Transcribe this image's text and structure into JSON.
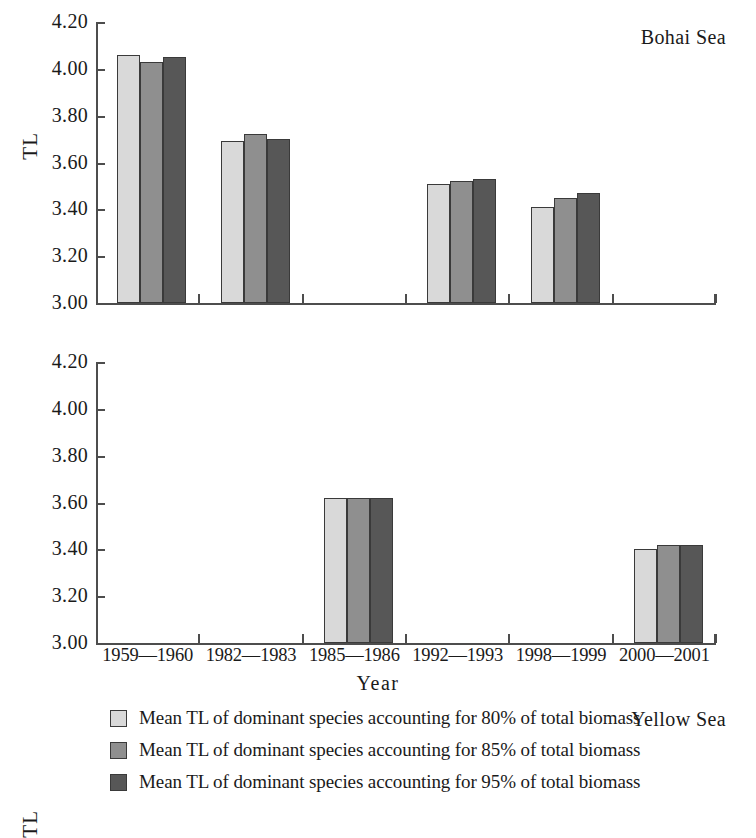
{
  "chart_data": {
    "type": "bar",
    "title": "",
    "xlabel": "Year",
    "ylabel": "TL",
    "ylim": [
      3.0,
      4.2
    ],
    "ytick_labels": [
      "4.20",
      "4.00",
      "3.80",
      "3.60",
      "3.40",
      "3.20",
      "3.00"
    ],
    "ytick_values": [
      4.2,
      4.0,
      3.8,
      3.6,
      3.4,
      3.2,
      3.0
    ],
    "grid": false,
    "legend_position": "bottom",
    "categories": [
      "1959—1960",
      "1982—1983",
      "1985—1986",
      "1992—1993",
      "1998—1999",
      "2000—2001"
    ],
    "legend": [
      "Mean TL of dominant species accounting for 80% of total biomass",
      "Mean TL of dominant species accounting for 85% of total biomass",
      "Mean TL of dominant species accounting for 95% of total biomass"
    ],
    "series_colors": [
      "#d9d9d9",
      "#8f8f8f",
      "#575757"
    ],
    "panels": [
      {
        "name": "Bohai Sea",
        "series": [
          {
            "name": "Mean TL of dominant species accounting for 80% of total biomass",
            "values": [
              4.06,
              3.69,
              null,
              3.51,
              3.41,
              null
            ]
          },
          {
            "name": "Mean TL of dominant species accounting for 85% of total biomass",
            "values": [
              4.03,
              3.72,
              null,
              3.52,
              3.45,
              null
            ]
          },
          {
            "name": "Mean TL of dominant species accounting for 95% of total biomass",
            "values": [
              4.05,
              3.7,
              null,
              3.53,
              3.47,
              null
            ]
          }
        ]
      },
      {
        "name": "Yellow Sea",
        "series": [
          {
            "name": "Mean TL of dominant species accounting for 80% of total biomass",
            "values": [
              null,
              null,
              3.62,
              null,
              null,
              3.4
            ]
          },
          {
            "name": "Mean TL of dominant species accounting for 85% of total biomass",
            "values": [
              null,
              null,
              3.62,
              null,
              null,
              3.42
            ]
          },
          {
            "name": "Mean TL of dominant species accounting for 95% of total biomass",
            "values": [
              null,
              null,
              3.62,
              null,
              null,
              3.42
            ]
          }
        ]
      }
    ]
  }
}
